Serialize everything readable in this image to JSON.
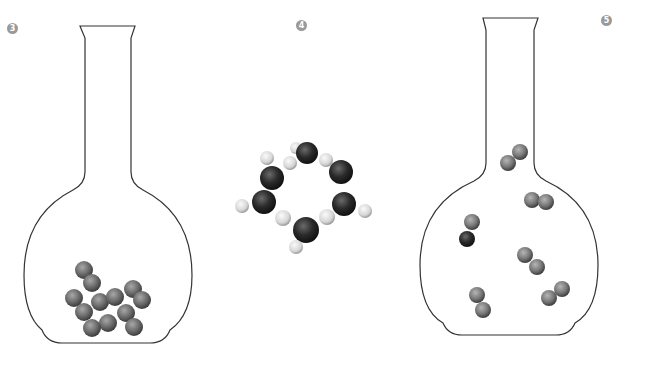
{
  "panels": [
    {
      "label": "3",
      "description": "flask with condensed spheres at bottom (liquid)"
    },
    {
      "label": "4",
      "description": "ring molecule of dark and light atoms"
    },
    {
      "label": "5",
      "description": "flask with diatomic molecules dispersed (gas)"
    }
  ],
  "colors": {
    "outline": "#333333",
    "sphere_dark": "#3a3a3a",
    "sphere_mid": "#6e6e6e",
    "sphere_light": "#d8d8d8",
    "label_bg": "#9a9a9a"
  }
}
